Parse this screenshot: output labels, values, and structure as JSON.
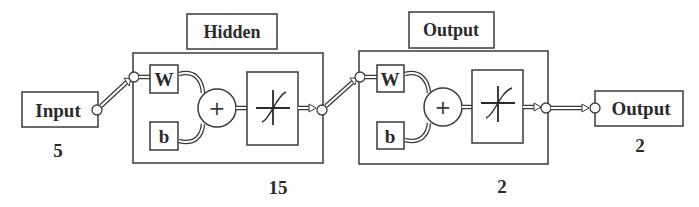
{
  "diagram": {
    "type": "neural-network-architecture",
    "colors": {
      "stroke": "#3a3a3a",
      "text": "#2a2a2a",
      "background": "#ffffff"
    },
    "input": {
      "label": "Input",
      "size": "5"
    },
    "hidden_layer": {
      "label": "Hidden",
      "weight_label": "W",
      "bias_label": "b",
      "sum_symbol": "+",
      "activation": "sigmoid-icon",
      "size": "15"
    },
    "output_layer": {
      "label": "Output",
      "weight_label": "W",
      "bias_label": "b",
      "sum_symbol": "+",
      "activation": "linear-sigmoid-icon",
      "size": "2"
    },
    "output": {
      "label": "Output",
      "size": "2"
    }
  }
}
